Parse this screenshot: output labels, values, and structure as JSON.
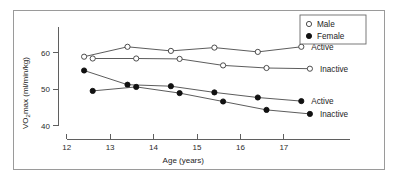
{
  "chart_data": {
    "type": "line",
    "title": "",
    "xlabel": "Age (years)",
    "ylabel": "VO2max (ml/min/kg)",
    "ylabel_main": "VO",
    "ylabel_sub": "2",
    "ylabel_rest": "max (ml/min/kg)",
    "xlim": [
      11.8,
      18.2
    ],
    "ylim": [
      38.5,
      66.5
    ],
    "xticks": [
      12,
      13,
      14,
      15,
      16,
      17
    ],
    "xtick_labels": [
      "12",
      "13",
      "14",
      "15",
      "16",
      "17"
    ],
    "yticks": [
      40,
      50,
      60
    ],
    "ytick_labels": [
      "40",
      "50",
      "60"
    ],
    "grid": false,
    "legend_position": "top-right",
    "legend": [
      {
        "label": "Male",
        "marker": "open-circle"
      },
      {
        "label": "Female",
        "marker": "filled-circle"
      }
    ],
    "series": [
      {
        "name": "Male Active",
        "group": "Male",
        "marker": "open-circle",
        "end_label": "Active",
        "x": [
          12.4,
          13.4,
          14.4,
          15.4,
          16.4,
          17.4
        ],
        "values": [
          58.9,
          61.6,
          60.5,
          61.4,
          60.2,
          61.6
        ]
      },
      {
        "name": "Male Inactive",
        "group": "Male",
        "marker": "open-circle",
        "end_label": "Inactive",
        "x": [
          12.6,
          13.6,
          14.6,
          15.6,
          16.6,
          17.6
        ],
        "values": [
          58.4,
          58.4,
          58.3,
          56.5,
          55.8,
          55.6
        ]
      },
      {
        "name": "Female Active",
        "group": "Female",
        "marker": "filled-circle",
        "end_label": "Active",
        "x": [
          12.4,
          13.4,
          14.4,
          15.4,
          16.4,
          17.4
        ],
        "values": [
          55.1,
          51.2,
          50.8,
          49.1,
          47.7,
          46.7
        ]
      },
      {
        "name": "Female Inactive",
        "group": "Female",
        "marker": "filled-circle",
        "end_label": "Inactive",
        "x": [
          12.6,
          13.6,
          14.6,
          15.6,
          16.6,
          17.6
        ],
        "values": [
          49.5,
          50.6,
          48.9,
          46.6,
          44.3,
          43.2
        ]
      }
    ],
    "series_end_labels": [
      {
        "text": "Active",
        "for": "Male Active"
      },
      {
        "text": "Inactive",
        "for": "Male Inactive"
      },
      {
        "text": "Active",
        "for": "Female Active"
      },
      {
        "text": "Inactive",
        "for": "Female Inactive"
      }
    ],
    "colors": {
      "line": "#4a4a4a",
      "axis": "#5f5f5f",
      "text": "#1d1d1d",
      "marker_fill_open": "#ffffff",
      "marker_fill_closed": "#111111",
      "frame": "#9a9a9a"
    }
  }
}
